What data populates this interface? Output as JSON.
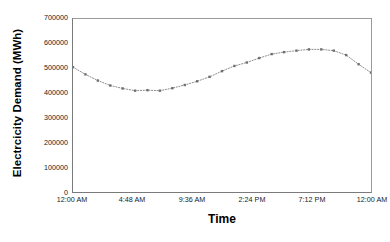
{
  "chart_data": {
    "type": "line",
    "title": "",
    "xlabel": "Time",
    "ylabel": "Electrcicity Demand  (MWh)",
    "ylim": [
      0,
      700000
    ],
    "y_ticks": [
      "700000",
      "600000",
      "500000",
      "400000",
      "300000",
      "200000",
      "100000",
      "0"
    ],
    "y_tick_values": [
      700000,
      600000,
      500000,
      400000,
      300000,
      200000,
      100000,
      0
    ],
    "x_tick_labels": [
      "12:00 AM",
      "4:48 AM",
      "9:36 AM",
      "2:24 PM",
      "7:12 PM",
      "12:00 AM"
    ],
    "x_tick_positions": [
      0,
      4.8,
      9.6,
      14.4,
      19.2,
      24
    ],
    "xlim": [
      0,
      24
    ],
    "grid": false,
    "legend": "none",
    "marker": "small-filled-square",
    "line_style": "dotted",
    "series_color": "#808080",
    "marker_color": "#6e6e6e",
    "x": [
      0,
      1,
      2,
      3,
      4,
      5,
      6,
      7,
      8,
      9,
      10,
      11,
      12,
      13,
      14,
      15,
      16,
      17,
      18,
      19,
      20,
      21,
      22,
      23,
      24
    ],
    "values": [
      505000,
      476000,
      451000,
      431000,
      419000,
      410000,
      412000,
      410000,
      420000,
      433000,
      448000,
      466000,
      489000,
      510000,
      524000,
      542000,
      558000,
      566000,
      572000,
      577000,
      577000,
      572000,
      554000,
      517000,
      483000
    ],
    "point_labels": [
      "12:00 AM",
      "1:00 AM",
      "2:00 AM",
      "3:00 AM",
      "4:00 AM",
      "5:00 AM",
      "6:00 AM",
      "7:00 AM",
      "8:00 AM",
      "9:00 AM",
      "10:00 AM",
      "11:00 AM",
      "12:00 PM",
      "1:00 PM",
      "2:00 PM",
      "3:00 PM",
      "4:00 PM",
      "5:00 PM",
      "6:00 PM",
      "7:00 PM",
      "8:00 PM",
      "9:00 PM",
      "10:00 PM",
      "11:00 PM",
      "12:00 AM"
    ]
  },
  "caption": {
    "smudge": ""
  }
}
